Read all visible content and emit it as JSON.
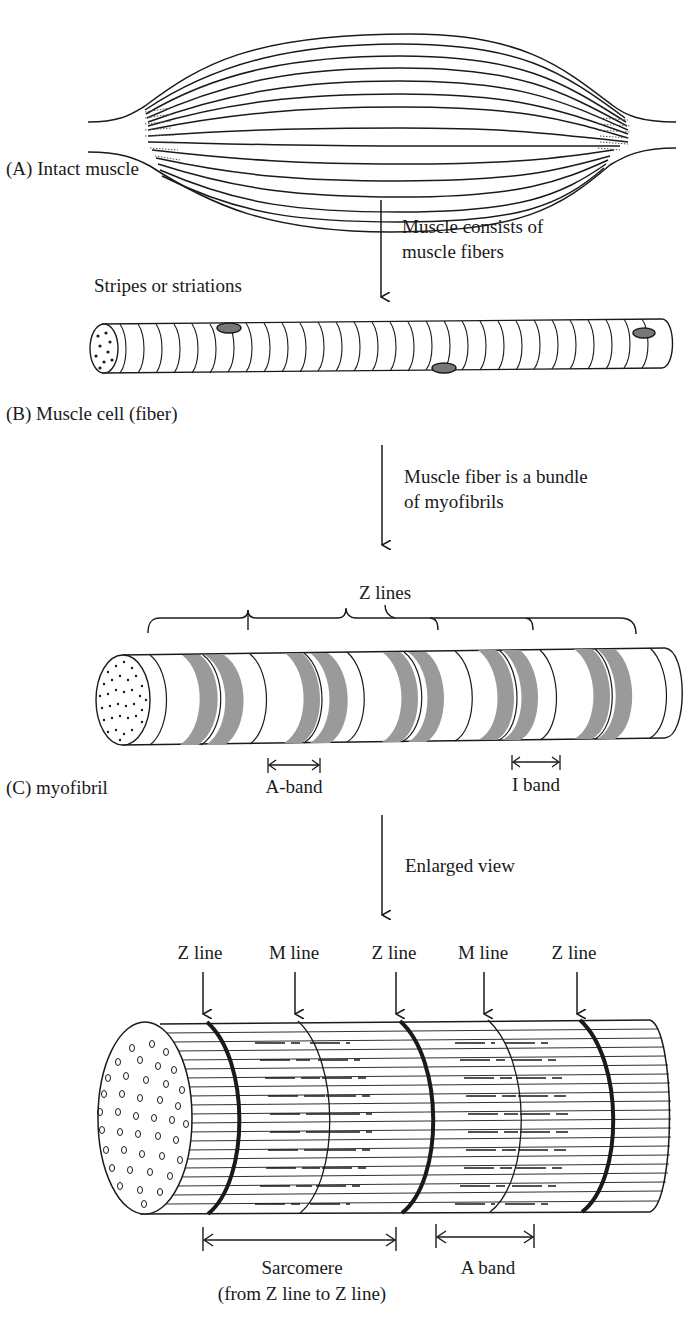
{
  "panels": {
    "a": {
      "label": "(A) Intact muscle"
    },
    "arrow1": {
      "line1": "Muscle consists of",
      "line2": "muscle fibers"
    },
    "b": {
      "striations_label": "Stripes or striations",
      "label": "(B) Muscle cell (fiber)"
    },
    "arrow2": {
      "line1": "Muscle fiber is a bundle",
      "line2": "of myofibrils"
    },
    "c": {
      "z_lines_label": "Z lines",
      "a_band_label": "A-band",
      "i_band_label": "I band",
      "label": "(C) myofibril"
    },
    "arrow3": {
      "line1": "Enlarged view"
    },
    "d": {
      "top_labels": [
        "Z line",
        "M line",
        "Z line",
        "M line",
        "Z line"
      ],
      "sarcomere_line1": "Sarcomere",
      "sarcomere_line2": "(from Z line to Z line)",
      "a_band_label": "A band"
    }
  },
  "colors": {
    "ink": "#1a1a1a",
    "band_gray": "#9a9a9a",
    "background": "#ffffff"
  }
}
